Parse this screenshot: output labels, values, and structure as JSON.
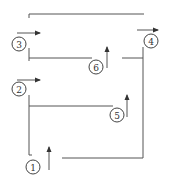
{
  "diagram": {
    "type": "numbered-path-diagram",
    "nodes": [
      {
        "id": "1",
        "label": "1",
        "cx": 33,
        "cy": 167
      },
      {
        "id": "2",
        "label": "2",
        "cx": 19,
        "cy": 89
      },
      {
        "id": "3",
        "label": "3",
        "cx": 19,
        "cy": 44
      },
      {
        "id": "4",
        "label": "4",
        "cx": 151,
        "cy": 41
      },
      {
        "id": "5",
        "label": "5",
        "cx": 117,
        "cy": 115
      },
      {
        "id": "6",
        "label": "6",
        "cx": 96,
        "cy": 67
      }
    ],
    "arrows": [
      {
        "near": "1",
        "direction": "up"
      },
      {
        "near": "2",
        "direction": "right"
      },
      {
        "near": "3",
        "direction": "right"
      },
      {
        "near": "4",
        "direction": "right"
      },
      {
        "near": "5",
        "direction": "up"
      },
      {
        "near": "6",
        "direction": "up"
      }
    ],
    "colors": {
      "line": "#555555",
      "text": "#333333",
      "background": "#ffffff"
    }
  }
}
